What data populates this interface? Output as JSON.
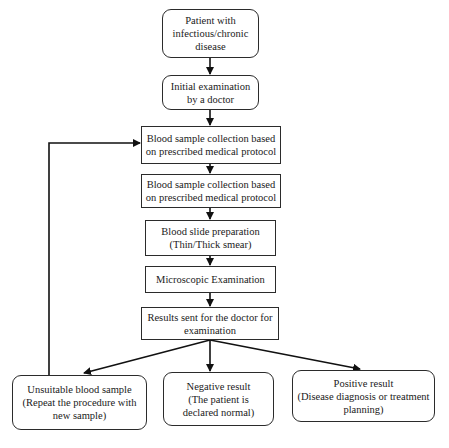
{
  "diagram": {
    "type": "flowchart",
    "nodes": [
      {
        "id": "patient",
        "lines": [
          "Patient with",
          "infectious/chronic",
          "disease"
        ],
        "shape": "rounded"
      },
      {
        "id": "initial_exam",
        "lines": [
          "Initial examination",
          "by a doctor"
        ],
        "shape": "rounded"
      },
      {
        "id": "collection_1",
        "lines": [
          "Blood sample collection based",
          "on prescribed medical protocol"
        ],
        "shape": "rect"
      },
      {
        "id": "collection_2",
        "lines": [
          "Blood sample collection based",
          "on prescribed medical protocol"
        ],
        "shape": "rect"
      },
      {
        "id": "slide_prep",
        "lines": [
          "Blood slide preparation",
          "(Thin/Thick smear)"
        ],
        "shape": "rect"
      },
      {
        "id": "microscopic",
        "lines": [
          "Microscopic Examination"
        ],
        "shape": "rect"
      },
      {
        "id": "results",
        "lines": [
          "Results sent for the doctor for",
          "examination"
        ],
        "shape": "rect"
      },
      {
        "id": "unsuitable",
        "lines": [
          "Unsuitable blood sample",
          "(Repeat the procedure with",
          "new sample)"
        ],
        "shape": "rounded"
      },
      {
        "id": "negative",
        "lines": [
          "Negative result",
          "(The patient is",
          "declared normal)"
        ],
        "shape": "rounded"
      },
      {
        "id": "positive",
        "lines": [
          "Positive result",
          "(Disease diagnosis or treatment",
          "planning)"
        ],
        "shape": "rounded"
      }
    ],
    "edges": [
      {
        "from": "patient",
        "to": "initial_exam"
      },
      {
        "from": "initial_exam",
        "to": "collection_1"
      },
      {
        "from": "collection_1",
        "to": "collection_2"
      },
      {
        "from": "collection_2",
        "to": "slide_prep"
      },
      {
        "from": "slide_prep",
        "to": "microscopic"
      },
      {
        "from": "microscopic",
        "to": "results"
      },
      {
        "from": "results",
        "to": "unsuitable"
      },
      {
        "from": "results",
        "to": "negative"
      },
      {
        "from": "results",
        "to": "positive"
      },
      {
        "from": "unsuitable",
        "to": "collection_1",
        "label": "feedback loop"
      }
    ]
  }
}
